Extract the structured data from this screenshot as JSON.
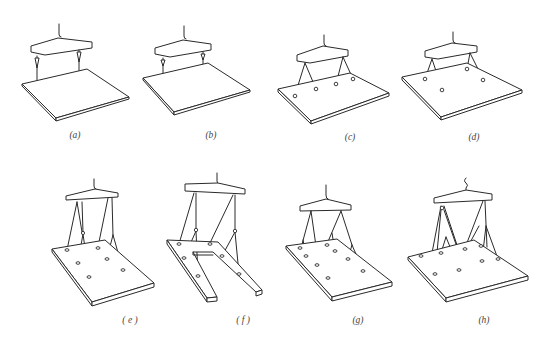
{
  "figure": {
    "panels": [
      {
        "id": "a",
        "label": "(a)",
        "description": "Flat slab lifted by spreader beam with two direct vertical hooks"
      },
      {
        "id": "b",
        "label": "(b)",
        "description": "Flat slab lifted by spreader beam with two vertical hooks and shackles"
      },
      {
        "id": "c",
        "label": "(c)",
        "description": "Flat slab lifted at four points via two V-shaped slings"
      },
      {
        "id": "d",
        "label": "(d)",
        "description": "Flat slab lifted at four points via two V-shaped slings (alternate arrangement)"
      },
      {
        "id": "e",
        "label": "( e )",
        "description": "Slab lifted at six points via multi-leg slings"
      },
      {
        "id": "f",
        "label": "( f )",
        "description": "U-shaped slab lifted at six points via multi-leg slings"
      },
      {
        "id": "g",
        "label": "(g)",
        "description": "Slab lifted at eight points via branching slings"
      },
      {
        "id": "h",
        "label": "(h)",
        "description": "Slab lifted at eight points via branching slings (alternate)"
      }
    ]
  },
  "colors": {
    "line": "#2a2a2a",
    "label": "#444444",
    "background": "#ffffff"
  }
}
